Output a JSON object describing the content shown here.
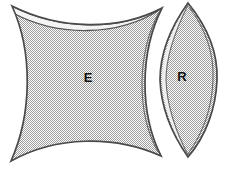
{
  "figure": {
    "background_color": "#ffffff",
    "outline_color": "#3b3b3b",
    "fill_color": "#c9c9c9",
    "fill_pattern": "dither-checker-gray",
    "highlight_color": "#f2f2f2",
    "label_color": "#111111",
    "width": 226,
    "height": 174
  },
  "shapes": [
    {
      "id": "region-e",
      "label": "E",
      "type": "astroid",
      "label_x": 88,
      "label_y": 79,
      "cusps": [
        {
          "x": 12,
          "y": 6
        },
        {
          "x": 162,
          "y": 8
        },
        {
          "x": 161,
          "y": 156
        },
        {
          "x": 11,
          "y": 161
        }
      ],
      "concave_extents": {
        "top_y": 27,
        "bottom_y": 142,
        "left_x": 21,
        "right_x": 151
      }
    },
    {
      "id": "region-r",
      "label": "R",
      "type": "lens",
      "label_x": 182,
      "label_y": 78,
      "tips": [
        {
          "x": 188,
          "y": 3
        },
        {
          "x": 188,
          "y": 157
        }
      ],
      "extents": {
        "left_x": 160,
        "right_x": 217,
        "mid_y": 80
      }
    }
  ],
  "labels": {
    "e": "E",
    "r": "R"
  }
}
